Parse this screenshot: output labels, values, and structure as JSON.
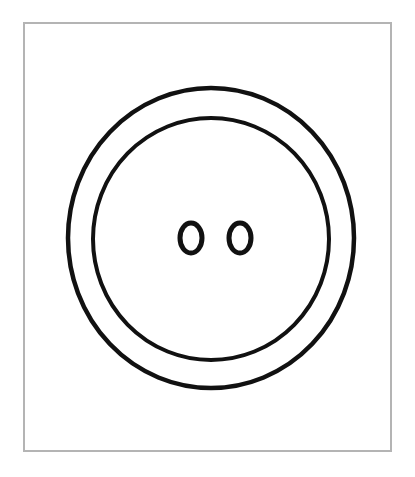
{
  "illustration": {
    "subject": "button",
    "frame_color": "#b4b4b4",
    "stroke_color": "#111111",
    "background": "#ffffff",
    "holes": 2
  }
}
